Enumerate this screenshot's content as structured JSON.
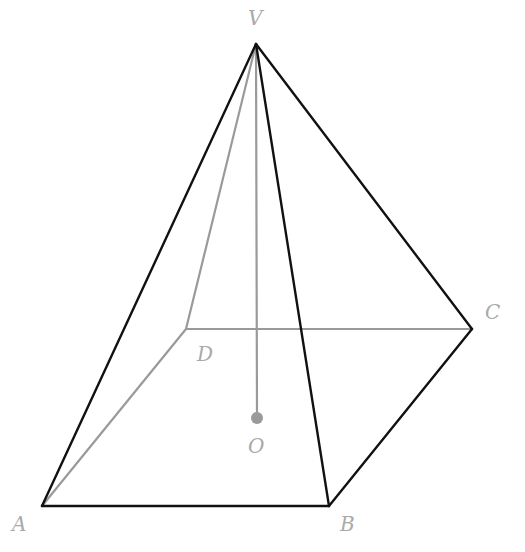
{
  "diagram": {
    "colors": {
      "visible_edge": "#111111",
      "hidden_edge": "#9a9a9a",
      "label": "#a9a9a9",
      "center_point": "#9a9a9a"
    },
    "vertices": {
      "V": {
        "label": "V",
        "x": 256,
        "y": 44
      },
      "A": {
        "label": "A",
        "x": 42,
        "y": 506
      },
      "B": {
        "label": "B",
        "x": 329,
        "y": 506
      },
      "C": {
        "label": "C",
        "x": 472,
        "y": 329
      },
      "D": {
        "label": "D",
        "x": 186,
        "y": 329
      },
      "O": {
        "label": "O",
        "x": 257,
        "y": 417
      }
    },
    "edges": {
      "visible": [
        [
          "V",
          "A"
        ],
        [
          "V",
          "B"
        ],
        [
          "V",
          "C"
        ],
        [
          "A",
          "B"
        ],
        [
          "B",
          "C"
        ]
      ],
      "hidden": [
        [
          "V",
          "D"
        ],
        [
          "A",
          "D"
        ],
        [
          "D",
          "C"
        ],
        [
          "V",
          "O"
        ]
      ]
    },
    "labels": {
      "V": "V",
      "A": "A",
      "B": "B",
      "C": "C",
      "D": "D",
      "O": "O"
    }
  }
}
